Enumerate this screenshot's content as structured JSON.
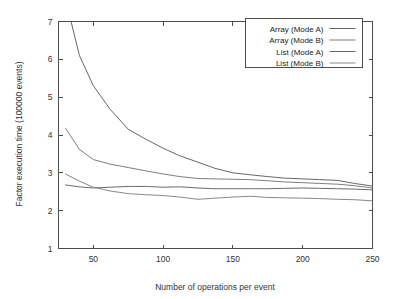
{
  "chart_data": {
    "type": "line",
    "title": "",
    "xlabel": "Number of operations per event",
    "ylabel": "Factor execution time (100000 events)",
    "xlim": [
      25,
      250
    ],
    "ylim": [
      1,
      7
    ],
    "xticks": [
      50,
      100,
      150,
      200,
      250
    ],
    "yticks": [
      1,
      2,
      3,
      4,
      5,
      6,
      7
    ],
    "grid": false,
    "legend_position": "top-right-inside",
    "series": [
      {
        "name": "Array (Mode A)",
        "color": "#555555",
        "x": [
          30,
          34,
          40,
          50,
          62,
          75,
          88,
          100,
          112,
          125,
          137,
          150,
          162,
          175,
          187,
          200,
          212,
          225,
          237,
          250
        ],
        "y": [
          9.4,
          7.0,
          6.1,
          5.3,
          4.68,
          4.15,
          3.88,
          3.65,
          3.45,
          3.28,
          3.12,
          3.0,
          2.95,
          2.9,
          2.86,
          2.84,
          2.82,
          2.8,
          2.72,
          2.65
        ]
      },
      {
        "name": "Array (Mode B)",
        "color": "#6e6e6e",
        "x": [
          30,
          40,
          50,
          62,
          75,
          88,
          100,
          112,
          125,
          137,
          150,
          162,
          175,
          187,
          200,
          212,
          225,
          237,
          250
        ],
        "y": [
          4.18,
          3.62,
          3.35,
          3.23,
          3.14,
          3.05,
          2.97,
          2.9,
          2.85,
          2.84,
          2.83,
          2.82,
          2.79,
          2.76,
          2.74,
          2.72,
          2.7,
          2.66,
          2.6
        ]
      },
      {
        "name": "List (Mode A)",
        "color": "#5a5a5a",
        "x": [
          30,
          40,
          50,
          62,
          75,
          88,
          100,
          112,
          125,
          137,
          150,
          162,
          175,
          187,
          200,
          212,
          225,
          237,
          250
        ],
        "y": [
          2.68,
          2.63,
          2.6,
          2.62,
          2.64,
          2.64,
          2.62,
          2.63,
          2.6,
          2.58,
          2.58,
          2.58,
          2.58,
          2.59,
          2.6,
          2.59,
          2.58,
          2.57,
          2.55
        ]
      },
      {
        "name": "List (Mode B)",
        "color": "#7a7a7a",
        "x": [
          30,
          40,
          50,
          62,
          75,
          88,
          100,
          112,
          125,
          137,
          150,
          162,
          175,
          187,
          200,
          212,
          225,
          237,
          250
        ],
        "y": [
          2.97,
          2.78,
          2.62,
          2.52,
          2.45,
          2.42,
          2.4,
          2.36,
          2.3,
          2.33,
          2.36,
          2.38,
          2.35,
          2.34,
          2.33,
          2.32,
          2.3,
          2.29,
          2.26
        ]
      }
    ]
  },
  "legend": {
    "entries": [
      {
        "label": "Array (Mode A)"
      },
      {
        "label": "Array (Mode B)"
      },
      {
        "label": "List (Mode A)"
      },
      {
        "label": "List (Mode B)"
      }
    ]
  },
  "axes": {
    "x_tick_labels": [
      "50",
      "100",
      "150",
      "200",
      "250"
    ],
    "y_tick_labels": [
      "1",
      "2",
      "3",
      "4",
      "5",
      "6",
      "7"
    ],
    "x_title": "Number of operations per event",
    "y_title": "Factor execution time (100000 events)"
  }
}
